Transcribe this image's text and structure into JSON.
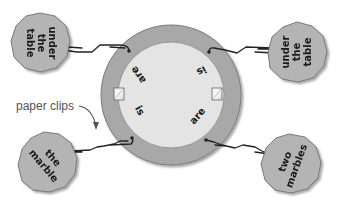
{
  "diagram": {
    "annotation": {
      "text": "paper clips"
    },
    "ring": {
      "outer_color": "#a8a8a8",
      "inner_color": "#e4e4e4",
      "words": [
        {
          "id": "top-left",
          "text": "are"
        },
        {
          "id": "top-right",
          "text": "is"
        },
        {
          "id": "bottom-left",
          "text": "is"
        },
        {
          "id": "bottom-right",
          "text": "are"
        }
      ]
    },
    "tags": [
      {
        "id": "top-left",
        "lines": [
          "under",
          "the",
          "table"
        ]
      },
      {
        "id": "top-right",
        "lines": [
          "under",
          "the",
          "table"
        ]
      },
      {
        "id": "bottom-left",
        "lines": [
          "the",
          "marble"
        ]
      },
      {
        "id": "bottom-right",
        "lines": [
          "two",
          "marbles"
        ]
      }
    ],
    "colors": {
      "tag_fill": "#b4b4b4",
      "tag_stroke": "#6e6e6e",
      "clip": "#222222"
    }
  }
}
